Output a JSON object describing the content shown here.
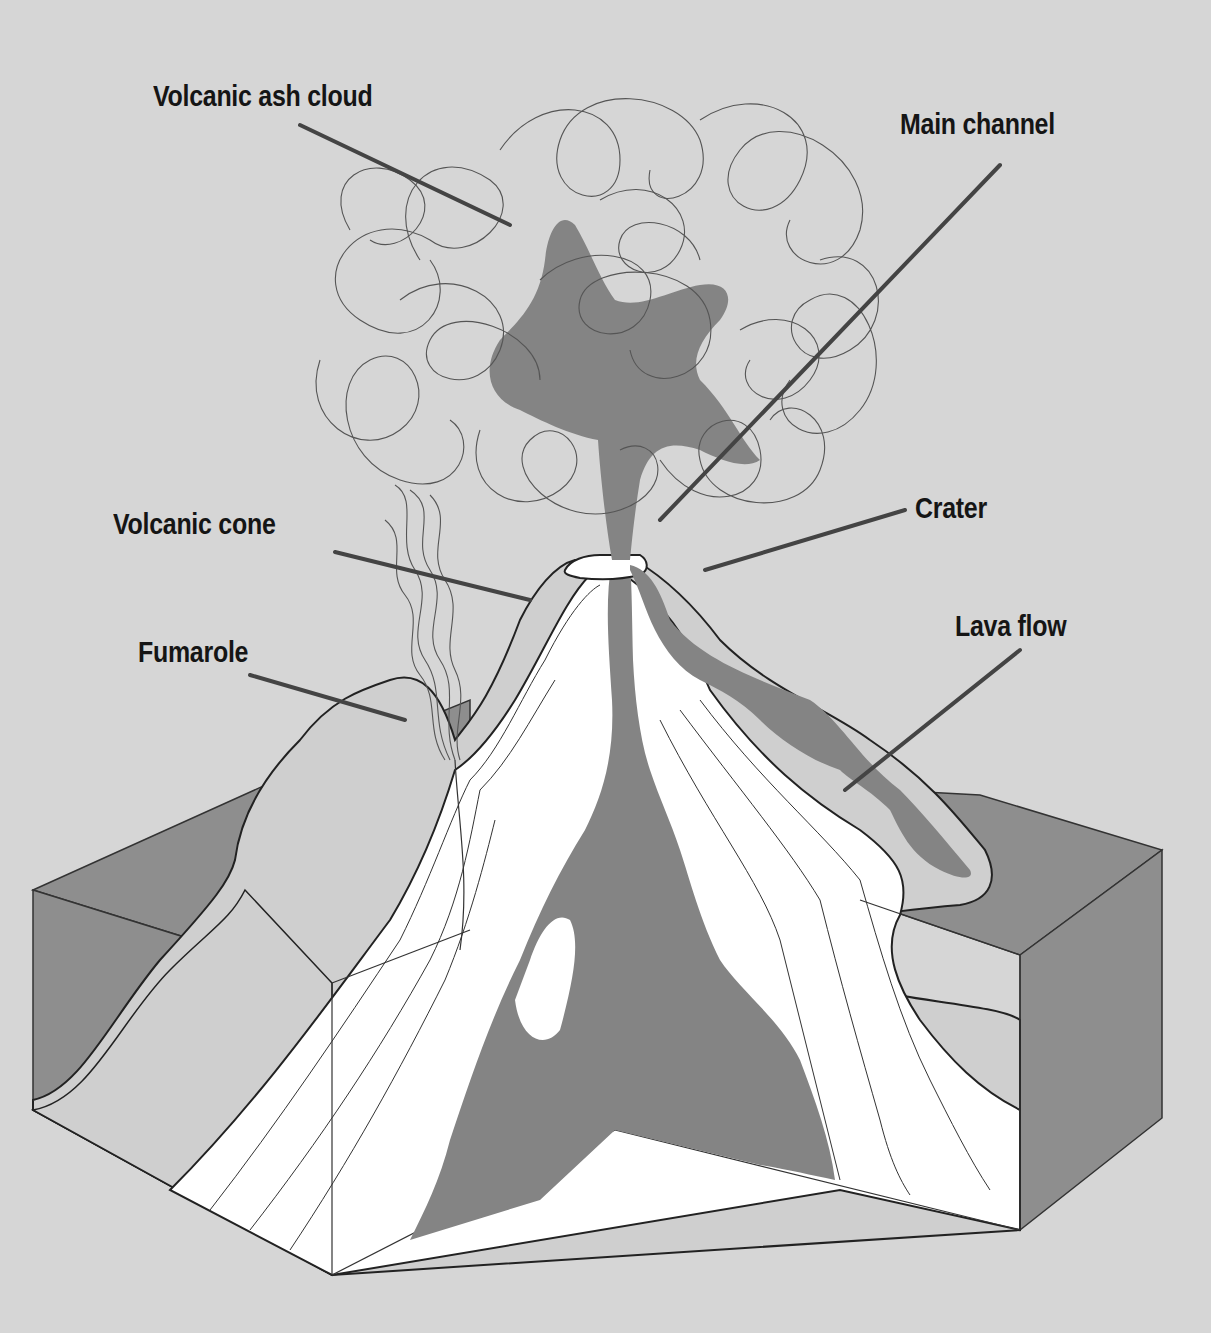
{
  "diagram": {
    "colors": {
      "background": "#d6d6d6",
      "magma": "#848484",
      "rock_face": "#8e8e8e",
      "cone_surface": "#cfcfcf",
      "strata": "#ffffff",
      "outline": "#333333",
      "leader_line": "#444444",
      "label_text": "#151515"
    },
    "labels": [
      {
        "id": "volcanic-ash-cloud",
        "text": "Volcanic ash cloud"
      },
      {
        "id": "main-channel",
        "text": "Main channel"
      },
      {
        "id": "crater",
        "text": "Crater"
      },
      {
        "id": "volcanic-cone",
        "text": "Volcanic cone"
      },
      {
        "id": "lava-flow",
        "text": "Lava flow"
      },
      {
        "id": "fumarole",
        "text": "Fumarole"
      }
    ]
  }
}
